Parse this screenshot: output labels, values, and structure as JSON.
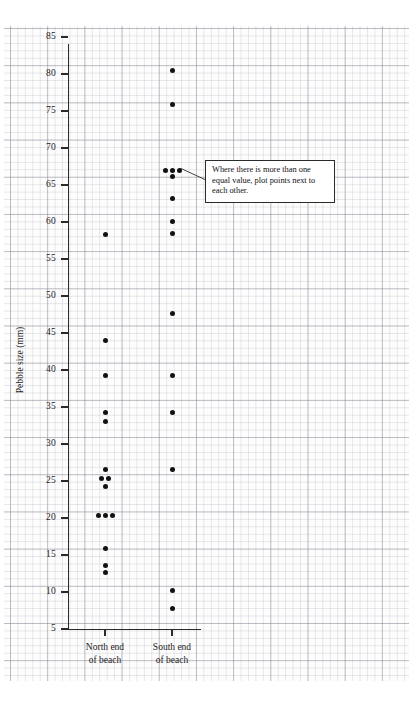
{
  "chart_data": {
    "type": "scatter",
    "title": "",
    "xlabel": "",
    "ylabel": "Pebble size (mm)",
    "ylim": [
      5,
      85
    ],
    "yticks": [
      5,
      10,
      15,
      20,
      25,
      30,
      35,
      40,
      45,
      50,
      55,
      60,
      65,
      70,
      75,
      80,
      85
    ],
    "ytick_labels": [
      "5",
      "10",
      "15",
      "20",
      "25",
      "30",
      "35",
      "40",
      "45",
      "50",
      "55",
      "60",
      "65",
      "70",
      "75",
      "80",
      "85"
    ],
    "grid": true,
    "grid_style": "graph-paper",
    "legend": "none",
    "categories": [
      "North end of beach",
      "South end of beach"
    ],
    "series": [
      {
        "name": "North end of beach",
        "points": [
          58.3,
          44.0,
          39.2,
          34.2,
          33.0,
          26.5,
          25.3,
          25.3,
          24.2,
          20.4,
          20.4,
          20.4,
          15.9,
          13.6,
          12.7
        ]
      },
      {
        "name": "South end of beach",
        "points": [
          80.5,
          75.9,
          67.0,
          67.0,
          67.0,
          66.1,
          63.2,
          60.1,
          58.4,
          47.7,
          39.2,
          34.2,
          26.5,
          10.2,
          7.8
        ]
      }
    ],
    "annotations": [
      {
        "text": "Where there is more than one equal value, plot points next to each other.",
        "points_to": "equal-value cluster at 67 mm, South end of beach"
      }
    ]
  },
  "axis": {
    "y_title": "Pebble size (mm)",
    "tick_labels": [
      "85",
      "80",
      "75",
      "70",
      "65",
      "60",
      "55",
      "50",
      "45",
      "40",
      "35",
      "30",
      "25",
      "20",
      "15",
      "10",
      "5"
    ]
  },
  "categories": [
    {
      "line1": "North end",
      "line2": "of beach"
    },
    {
      "line1": "South end",
      "line2": "of beach"
    }
  ],
  "callout": {
    "text": "Where there is more than one equal value, plot points next to each other."
  },
  "colors": {
    "dot": "#121212",
    "axis": "#2b2b2b",
    "grid_major": "#78788a",
    "grid_minor": "#9696a5",
    "paper": "#fdfdfd"
  }
}
